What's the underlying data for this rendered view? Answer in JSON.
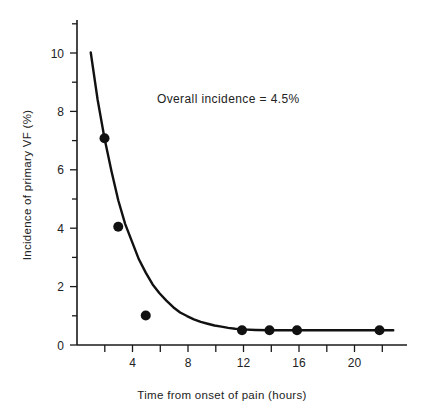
{
  "chart_data": {
    "type": "scatter",
    "title": "",
    "subtitle": "",
    "xlabel": "Time from onset of pain (hours)",
    "ylabel": "Incidence of primary VF (%)",
    "xlim": [
      0,
      24
    ],
    "ylim": [
      0,
      11
    ],
    "grid": false,
    "legend": null,
    "x_ticks_major": [
      4,
      8,
      12,
      16,
      20
    ],
    "x_ticks_all": [
      2,
      4,
      6,
      8,
      10,
      12,
      14,
      16,
      18,
      20,
      22
    ],
    "x_tick_labels": [
      "4",
      "8",
      "12",
      "16",
      "20"
    ],
    "y_ticks_major": [
      0,
      2,
      4,
      6,
      8,
      10
    ],
    "y_ticks_minor": [
      1,
      3,
      5,
      7,
      9,
      11
    ],
    "y_tick_labels": [
      "0",
      "2",
      "4",
      "6",
      "8",
      "10"
    ],
    "points": [
      {
        "x": 2,
        "y": 7.0
      },
      {
        "x": 3,
        "y": 4.0
      },
      {
        "x": 5,
        "y": 1.0
      },
      {
        "x": 12,
        "y": 0.5
      },
      {
        "x": 14,
        "y": 0.5
      },
      {
        "x": 16,
        "y": 0.5
      },
      {
        "x": 22,
        "y": 0.5
      }
    ],
    "series": [
      {
        "name": "fitted exponential decay",
        "type": "line",
        "x": [
          1.0,
          1.5,
          2.0,
          2.5,
          3.0,
          3.5,
          4.0,
          4.5,
          5.0,
          5.5,
          6.0,
          6.5,
          7.0,
          7.5,
          8.0,
          8.5,
          9.0,
          9.5,
          10.0,
          10.5,
          11.0,
          11.5,
          12.0,
          13.0,
          14.0,
          15.0,
          16.0,
          17.0,
          18.0,
          19.0,
          20.0,
          21.0,
          22.0,
          23.0
        ],
        "values": [
          9.9,
          8.3,
          7.0,
          5.9,
          4.9,
          4.1,
          3.5,
          2.9,
          2.45,
          2.05,
          1.75,
          1.5,
          1.28,
          1.1,
          0.98,
          0.87,
          0.78,
          0.72,
          0.66,
          0.62,
          0.58,
          0.55,
          0.53,
          0.51,
          0.5,
          0.5,
          0.5,
          0.5,
          0.5,
          0.5,
          0.5,
          0.5,
          0.5,
          0.5
        ]
      }
    ],
    "annotations": [
      {
        "name": "overall-incidence-annotation",
        "text": "Overall incidence  =  4.5%",
        "x": 11.0,
        "y": 8.2
      }
    ],
    "colors": {
      "curve": "#111111",
      "points": "#111111",
      "axis": "#1a1a1a",
      "text": "#222222",
      "background": "#ffffff"
    }
  }
}
